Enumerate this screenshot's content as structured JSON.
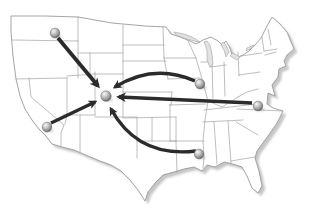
{
  "figure": {
    "type": "map",
    "region": "contiguous-united-states"
  },
  "map": {
    "width": 315,
    "height": 211,
    "colors": {
      "background": "#ffffff",
      "land": "#ffffff",
      "state_border": "#9b9b9b",
      "lake": "#e2e2e2",
      "drop_shadow": "#c6c6c6",
      "arrow": "#2b2b2b",
      "marker_stroke": "#5a5a5a"
    },
    "outline_path": "M 11,16 L 45,16 L 78,17 L 112,23 L 145,26 L 166,27 L 171,34 L 180,37 L 190,41 L 196,44 L 203,40 L 211,37 L 218,41 L 222,45 L 226,41 L 229,46 L 232,54 L 237,58 L 243,55 L 249,51 L 255,45 L 261,38 L 267,26 L 272,17 L 279,23 L 287,32 L 291,42 L 294,49 L 287,55 L 284,61 L 286,66 L 279,69 L 278,77 L 272,85 L 275,96 L 268,93 L 267,104 L 273,108 L 283,111 L 277,123 L 268,136 L 257,151 L 255,158 L 259,171 L 262,186 L 258,193 L 252,188 L 247,176 L 242,167 L 233,164 L 224,162 L 215,167 L 207,165 L 202,171 L 194,167 L 184,169 L 174,172 L 163,175 L 155,183 L 148,192 L 145,201 L 138,190 L 130,180 L 121,171 L 111,165 L 100,161 L 88,156 L 74,150 L 62,147 L 52,144 L 46,136 L 39,129 L 32,120 L 25,109 L 20,96 L 16,79 L 13,56 L 11,32 Z",
    "state_border_paths": [
      "M 12,40 L 78,41",
      "M 78,17 L 78,78",
      "M 16,79 L 67,78",
      "M 67,76 L 95,74",
      "M 29,78 L 31,97 L 64,125",
      "M 64,125 L 61,133 L 61,146",
      "M 67,78 L 67,115 L 65,124",
      "M 95,72 L 95,115",
      "M 63,115 L 95,115",
      "M 95,117 L 137,117",
      "M 80,115 L 80,152",
      "M 78,53 L 123,53",
      "M 90,53 L 90,75",
      "M 95,74 L 123,74",
      "M 123,25 L 123,117",
      "M 163,27 L 164,58",
      "M 123,45 L 164,45",
      "M 123,61 L 166,61",
      "M 123,92 L 172,92",
      "M 123,118 L 176,117",
      "M 137,118 L 137,158",
      "M 152,118 L 152,141",
      "M 137,141 L 176,141",
      "M 164,58 L 196,58",
      "M 188,41 L 196,58",
      "M 164,58 L 168,79",
      "M 168,79 L 200,78",
      "M 196,58 L 202,79 L 208,101 L 205,120 L 203,141 L 204,158 L 203,168",
      "M 169,105 L 206,104",
      "M 170,141 L 204,141",
      "M 172,92 L 171,105",
      "M 170,105 L 170,141",
      "M 176,117 L 176,141",
      "M 176,141 L 177,172",
      "M 201,62 L 212,62",
      "M 212,62 L 213,98",
      "M 224,62 L 225,96",
      "M 208,101 L 222,107 L 238,97",
      "M 210,67 L 226,65",
      "M 238,52 L 239,76",
      "M 239,75 L 260,72",
      "M 238,97 L 247,92 L 258,89",
      "M 204,110 L 257,104",
      "M 203,122 L 243,120",
      "M 214,122 L 217,164",
      "M 228,121 L 231,163",
      "M 231,161 L 255,157",
      "M 237,109 L 283,111",
      "M 236,122 L 258,135",
      "M 241,56 L 262,53",
      "M 268,29 L 271,45",
      "M 262,37 L 264,51",
      "M 264,51 L 277,49",
      "M 265,55 L 276,52"
    ],
    "lakes": [
      {
        "name": "lake-superior",
        "path": "M 174,32 L 184,34 L 194,38 L 200,42 L 194,41 L 184,38 L 176,35 Z"
      },
      {
        "name": "lake-michigan",
        "path": "M 204,42 L 207,50 L 207,60 L 210,67 L 213,64 L 212,54 L 210,45 L 207,41 Z"
      },
      {
        "name": "lake-huron",
        "path": "M 221,45 L 224,50 L 226,57 L 229,52 L 226,45 L 223,42 Z"
      },
      {
        "name": "lake-erie",
        "path": "M 230,56 L 237,60 L 240,57 L 233,53 Z"
      },
      {
        "name": "lake-ontario",
        "path": "M 247,48 L 254,45 L 252,48 L 246,51 Z"
      }
    ],
    "marker_style": {
      "radius": 4.8,
      "hub_radius": 5.2,
      "gradient_stops": [
        [
          "0%",
          "#f7f7f7"
        ],
        [
          "40%",
          "#c6c6c6"
        ],
        [
          "78%",
          "#8e8e8e"
        ],
        [
          "100%",
          "#5f5f5f"
        ]
      ],
      "shadow_opacity": 0.18
    },
    "markers": [
      {
        "id": "hub",
        "name": "hub-marker",
        "region": "mountain-west-hub",
        "x": 106,
        "y": 96,
        "r": 5.2
      },
      {
        "id": "pacific-northwest",
        "name": "pacific-northwest-marker",
        "region": "pacific-northwest",
        "x": 55,
        "y": 33,
        "r": 4.8
      },
      {
        "id": "southern-california",
        "name": "southern-california-marker",
        "region": "southern-california",
        "x": 47,
        "y": 127,
        "r": 4.8
      },
      {
        "id": "midwest",
        "name": "midwest-marker",
        "region": "midwest-great-lakes",
        "x": 200,
        "y": 84,
        "r": 4.8
      },
      {
        "id": "mid-atlantic",
        "name": "mid-atlantic-marker",
        "region": "mid-atlantic-coast",
        "x": 258,
        "y": 106,
        "r": 4.8
      },
      {
        "id": "south-central",
        "name": "south-central-marker",
        "region": "gulf-south",
        "x": 199,
        "y": 154,
        "r": 4.8
      }
    ],
    "arrows": [
      {
        "id": "pacific-northwest-to-hub",
        "from": "pacific-northwest",
        "to": "hub",
        "path": "M 58,38 L 98,86",
        "width": 3.8
      },
      {
        "id": "southern-california-to-hub",
        "from": "southern-california",
        "to": "hub",
        "path": "M 51,123 L 95,102",
        "width": 3.4
      },
      {
        "id": "midwest-to-hub",
        "from": "midwest",
        "to": "hub",
        "path": "M 195,81 Q 154,63 115,87",
        "width": 3.4
      },
      {
        "id": "mid-atlantic-to-hub",
        "from": "mid-atlantic",
        "to": "hub",
        "path": "M 252,103 L 119,97",
        "width": 3.7
      },
      {
        "id": "south-central-to-hub",
        "from": "south-central",
        "to": "hub",
        "path": "M 196,151 Q 138,158 111,109",
        "width": 3.4
      }
    ]
  }
}
